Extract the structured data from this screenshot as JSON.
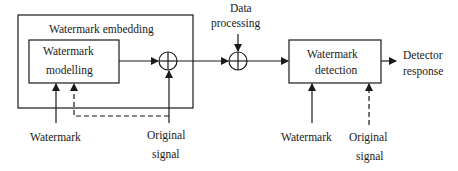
{
  "diagram": {
    "embedding_block": {
      "title": "Watermark embedding"
    },
    "modelling_block": {
      "line1": "Watermark",
      "line2": "modelling"
    },
    "data_processing": {
      "line1": "Data",
      "line2": "processing"
    },
    "detection_block": {
      "line1": "Watermark",
      "line2": "detection"
    },
    "detector_output": {
      "line1": "Detector",
      "line2": "response"
    },
    "inputs_left": {
      "watermark": "Watermark",
      "original_signal_line1": "Original",
      "original_signal_line2": "signal"
    },
    "inputs_right": {
      "watermark": "Watermark",
      "original_signal_line1": "Original",
      "original_signal_line2": "signal"
    },
    "colors": {
      "stroke": "#1a1a1a",
      "background": "#ffffff"
    }
  }
}
